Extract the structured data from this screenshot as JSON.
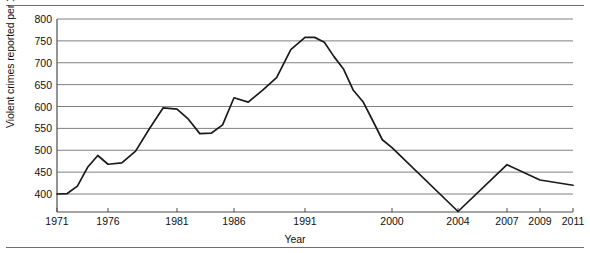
{
  "chart_data": {
    "type": "line",
    "title": "",
    "xlabel": "Year",
    "ylabel": "Violent crimes reported per 100,000 population",
    "ylim": [
      359,
      800
    ],
    "yticks": [
      400,
      450,
      500,
      550,
      600,
      650,
      700,
      750,
      800
    ],
    "ytick_labels": [
      "400",
      "450",
      "500",
      "550",
      "600",
      "650",
      "700",
      "750",
      "800"
    ],
    "xticks": [
      1971,
      1976,
      1981,
      1986,
      1991,
      2000,
      2004,
      2007,
      2009,
      2011
    ],
    "xtick_labels": [
      "1971",
      "1976",
      "1981",
      "1986",
      "1991",
      "2000",
      "2004",
      "2007",
      "2009",
      "2011"
    ],
    "grid": "horizontal",
    "legend": "none",
    "line_color": "#1a1a1a",
    "grid_color": "#808080",
    "axis_color": "#4d4d4d",
    "x": [
      1971,
      1972,
      1973,
      1974,
      1975,
      1976,
      1977,
      1978,
      1979,
      1980,
      1981,
      1982,
      1983,
      1984,
      1985,
      1986,
      1987,
      1988,
      1989,
      1990,
      1991,
      1992,
      1993,
      1994,
      1995,
      1996,
      1997,
      1998,
      1999,
      2000,
      2004,
      2007,
      2009,
      2011
    ],
    "values": [
      400,
      401,
      418,
      461,
      488,
      468,
      471,
      498,
      549,
      597,
      594,
      571,
      538,
      539,
      558,
      620,
      610,
      637,
      666,
      730,
      758,
      758,
      747,
      714,
      685,
      637,
      611,
      568,
      524,
      506,
      360,
      467,
      432,
      420
    ],
    "series": [
      {
        "name": "Violent crimes reported per 100,000 population",
        "values": [
          400,
          401,
          418,
          461,
          488,
          468,
          471,
          498,
          549,
          597,
          594,
          571,
          538,
          539,
          558,
          620,
          610,
          637,
          666,
          730,
          758,
          758,
          747,
          714,
          685,
          637,
          611,
          568,
          524,
          506,
          360,
          467,
          432,
          420
        ]
      }
    ]
  }
}
